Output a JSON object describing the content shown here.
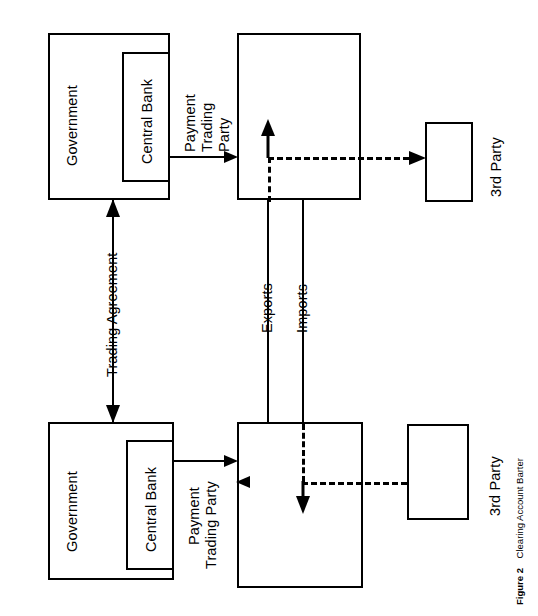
{
  "figure": {
    "number_label": "Figure 2",
    "caption": "Clearing Account Barter"
  },
  "nodes": {
    "government_top": "Government",
    "central_bank_top": "Central Bank",
    "trading_party_top": "",
    "third_party_top": "3rd Party",
    "government_bottom": "Government",
    "central_bank_bottom": "Central Bank",
    "trading_party_bottom": "",
    "third_party_bottom": "3rd Party"
  },
  "edges": {
    "payment_top_line1": "Payment",
    "payment_top_line2": "Trading",
    "payment_top_line3": "Party",
    "payment_bottom_line1": "Payment",
    "payment_bottom_line2": "Trading Party",
    "trading_agreement": "Trading Agreement",
    "exports": "Exports",
    "imports": "Imports"
  },
  "colors": {
    "stroke": "#000000",
    "background": "#ffffff"
  }
}
